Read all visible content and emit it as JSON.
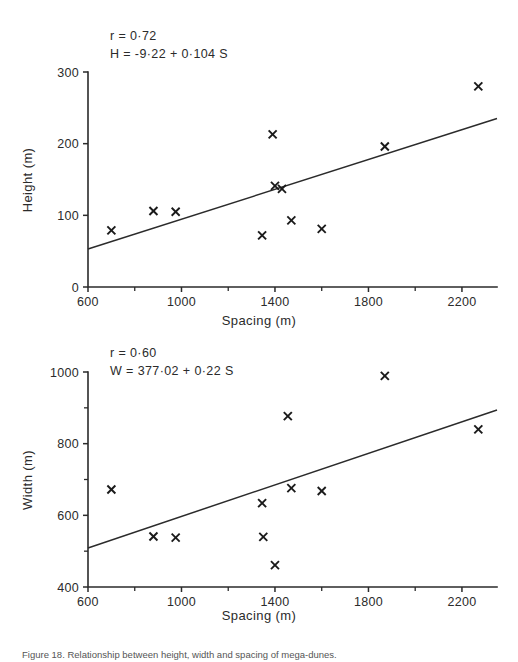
{
  "figure": {
    "caption": "Figure 18. Relationship between height, width and spacing of mega-dunes."
  },
  "chart_data": [
    {
      "id": "height-vs-spacing",
      "type": "scatter",
      "title": "",
      "xlabel": "Spacing   (m)",
      "ylabel": "Height  (m)",
      "xlim": [
        600,
        2350
      ],
      "ylim": [
        0,
        300
      ],
      "xticks": [
        600,
        1000,
        1400,
        1800,
        2200
      ],
      "yticks": [
        0,
        100,
        200,
        300
      ],
      "xtick_labels": [
        "600",
        "1000",
        "1400",
        "1800",
        "2200"
      ],
      "ytick_labels": [
        "0",
        "100",
        "200",
        "300"
      ],
      "grid": false,
      "legend": "none",
      "annotations": [
        "r  =  0·72",
        "H  =  -9·22  +  0·104  S"
      ],
      "correlation": 0.72,
      "fit_intercept": -9.22,
      "fit_slope": 0.104,
      "fit_equation": "H = -9·22 + 0·104 S",
      "fit_line": {
        "x0": 600,
        "y0": 53,
        "x1": 2350,
        "y1": 235
      },
      "marker": "x",
      "points": [
        {
          "x": 700,
          "y": 79
        },
        {
          "x": 880,
          "y": 106
        },
        {
          "x": 975,
          "y": 105
        },
        {
          "x": 1345,
          "y": 72
        },
        {
          "x": 1390,
          "y": 213
        },
        {
          "x": 1400,
          "y": 141
        },
        {
          "x": 1430,
          "y": 137
        },
        {
          "x": 1470,
          "y": 93
        },
        {
          "x": 1600,
          "y": 81
        },
        {
          "x": 1870,
          "y": 196
        },
        {
          "x": 2270,
          "y": 280
        }
      ]
    },
    {
      "id": "width-vs-spacing",
      "type": "scatter",
      "title": "",
      "xlabel": "Spacing   (m)",
      "ylabel": "Width  (m)",
      "xlim": [
        600,
        2350
      ],
      "ylim": [
        400,
        1000
      ],
      "xticks": [
        600,
        1000,
        1400,
        1800,
        2200
      ],
      "yticks": [
        400,
        600,
        800,
        1000
      ],
      "ytick_minor": [
        500,
        700,
        900
      ],
      "xtick_labels": [
        "600",
        "1000",
        "1400",
        "1800",
        "2200"
      ],
      "ytick_labels": [
        "400",
        "600",
        "800",
        "1000"
      ],
      "grid": false,
      "legend": "none",
      "annotations": [
        "r  =  0·60",
        "W  =  377·02  +  0·22  S"
      ],
      "correlation": 0.6,
      "fit_intercept": 377.02,
      "fit_slope": 0.22,
      "fit_equation": "W = 377·02 + 0·22 S",
      "fit_line": {
        "x0": 600,
        "y0": 509,
        "x1": 2350,
        "y1": 894
      },
      "marker": "x",
      "points": [
        {
          "x": 700,
          "y": 672
        },
        {
          "x": 880,
          "y": 541
        },
        {
          "x": 975,
          "y": 538
        },
        {
          "x": 1345,
          "y": 634
        },
        {
          "x": 1350,
          "y": 540
        },
        {
          "x": 1400,
          "y": 461
        },
        {
          "x": 1455,
          "y": 877
        },
        {
          "x": 1470,
          "y": 676
        },
        {
          "x": 1600,
          "y": 668
        },
        {
          "x": 1870,
          "y": 989
        },
        {
          "x": 2270,
          "y": 840
        }
      ]
    }
  ]
}
